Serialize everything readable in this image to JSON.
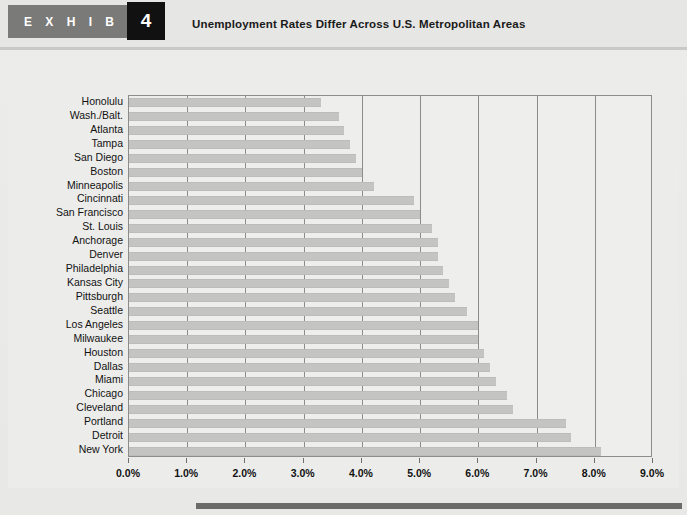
{
  "header": {
    "exhibit_word": "E X H I B I T",
    "exhibit_number": "4",
    "title": "Unemployment Rates Differ Across U.S. Metropolitan Areas"
  },
  "colors": {
    "tag_gray": "#7a7a78",
    "number_box": "#111111",
    "bar_fill": "#c4c4c2",
    "frame": "#8c8c8a",
    "page_bg": "#ececea",
    "footer_bar": "#6b6b69"
  },
  "chart_data": {
    "type": "bar",
    "orientation": "horizontal",
    "title": "Unemployment Rates Differ Across U.S. Metropolitan Areas",
    "xlabel": "",
    "ylabel": "",
    "xlim": [
      0,
      9
    ],
    "grid": true,
    "legend": null,
    "xticks": [
      0,
      1,
      2,
      3,
      4,
      5,
      6,
      7,
      8,
      9
    ],
    "xtick_labels": [
      "0.0%",
      "1.0%",
      "2.0%",
      "3.0%",
      "4.0%",
      "5.0%",
      "6.0%",
      "7.0%",
      "8.0%",
      "9.0%"
    ],
    "categories": [
      "Honolulu",
      "Wash./Balt.",
      "Atlanta",
      "Tampa",
      "San Diego",
      "Boston",
      "Minneapolis",
      "Cincinnati",
      "San Francisco",
      "St. Louis",
      "Anchorage",
      "Denver",
      "Philadelphia",
      "Kansas City",
      "Pittsburgh",
      "Seattle",
      "Los Angeles",
      "Milwaukee",
      "Houston",
      "Dallas",
      "Miami",
      "Chicago",
      "Cleveland",
      "Portland",
      "Detroit",
      "New York"
    ],
    "values": [
      3.3,
      3.6,
      3.7,
      3.8,
      3.9,
      4.0,
      4.2,
      4.9,
      5.0,
      5.2,
      5.3,
      5.3,
      5.4,
      5.5,
      5.6,
      5.8,
      6.0,
      6.0,
      6.1,
      6.2,
      6.3,
      6.5,
      6.6,
      7.5,
      7.6,
      8.1
    ]
  }
}
